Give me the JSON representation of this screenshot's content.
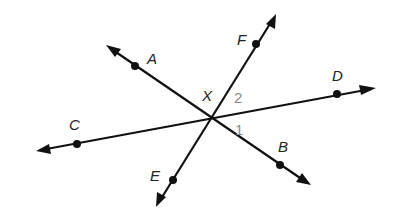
{
  "diagram": {
    "intersection": {
      "label": "X",
      "x": 211,
      "y": 119,
      "label_x": 202,
      "label_y": 101
    },
    "lines": [
      {
        "name": "line-AB",
        "from": {
          "x": 106,
          "y": 45
        },
        "to": {
          "x": 311,
          "y": 185
        }
      },
      {
        "name": "line-CD",
        "from": {
          "x": 36,
          "y": 151
        },
        "to": {
          "x": 376,
          "y": 88
        }
      },
      {
        "name": "line-EF",
        "from": {
          "x": 156,
          "y": 207
        },
        "to": {
          "x": 276,
          "y": 14
        }
      }
    ],
    "points": [
      {
        "label": "A",
        "x": 135,
        "y": 66,
        "label_x": 147,
        "label_y": 64
      },
      {
        "label": "B",
        "x": 280,
        "y": 165,
        "label_x": 278,
        "label_y": 152
      },
      {
        "label": "C",
        "x": 77,
        "y": 144,
        "label_x": 69,
        "label_y": 130
      },
      {
        "label": "D",
        "x": 337,
        "y": 94,
        "label_x": 332,
        "label_y": 81
      },
      {
        "label": "E",
        "x": 173,
        "y": 180,
        "label_x": 150,
        "label_y": 181
      },
      {
        "label": "F",
        "x": 256,
        "y": 44,
        "label_x": 237,
        "label_y": 45
      }
    ],
    "angles": [
      {
        "label": "1",
        "x": 235,
        "y": 135
      },
      {
        "label": "2",
        "x": 234,
        "y": 103
      }
    ],
    "colors": {
      "line": "#111111",
      "label": "#222222",
      "angle_label": "#8a8a8a"
    }
  }
}
